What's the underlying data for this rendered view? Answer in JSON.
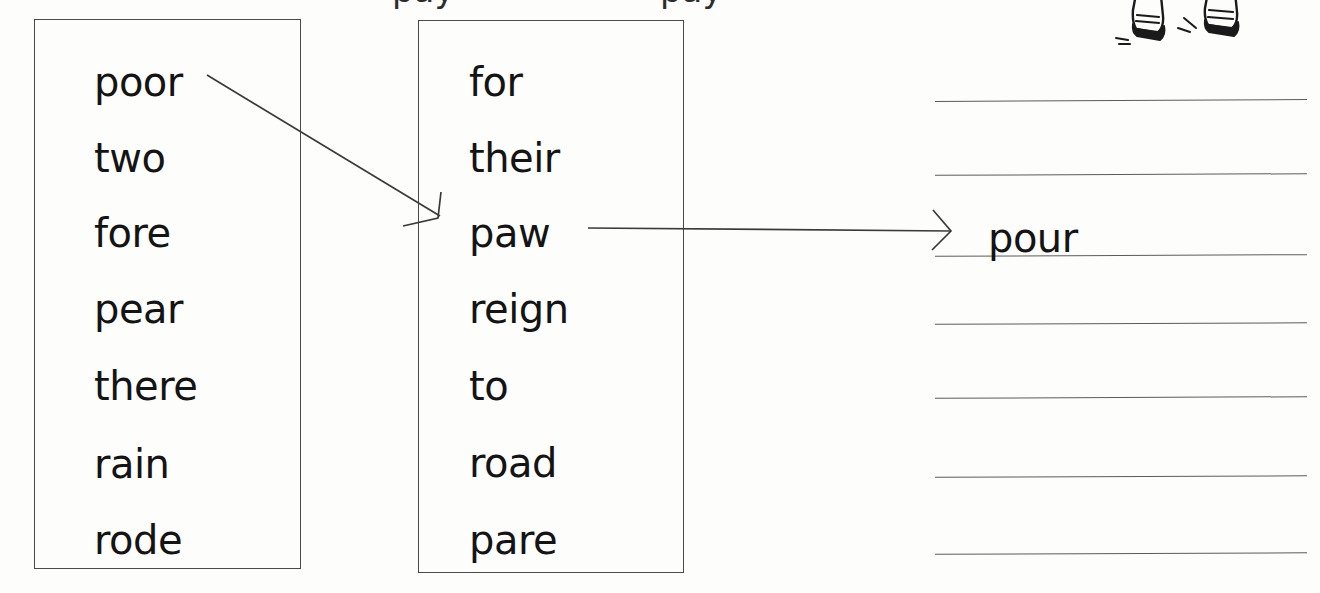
{
  "worksheet": {
    "title": "Homophone matching worksheet",
    "heading_remnant": "pay",
    "ink_color": "#141414",
    "line_color": "#5c5c5c",
    "box_border_color": "#4a4a4a",
    "paper_color": "#fdfdfc"
  },
  "columns": [
    {
      "name": "left-word-box",
      "words": [
        "poor",
        "two",
        "fore",
        "pear",
        "there",
        "rain",
        "rode"
      ]
    },
    {
      "name": "right-word-box",
      "words": [
        "for",
        "their",
        "paw",
        "reign",
        "to",
        "road",
        "pare"
      ]
    }
  ],
  "answer_area": {
    "line_count": 7,
    "entries": [
      {
        "line": 1,
        "text": ""
      },
      {
        "line": 2,
        "text": ""
      },
      {
        "line": 3,
        "text": "pour"
      },
      {
        "line": 4,
        "text": ""
      },
      {
        "line": 5,
        "text": ""
      },
      {
        "line": 6,
        "text": ""
      },
      {
        "line": 7,
        "text": ""
      }
    ]
  },
  "connections": [
    {
      "name": "poor-to-paw",
      "from": "poor",
      "to": "paw",
      "style": "diagonal-arrow"
    },
    {
      "name": "paw-to-pour",
      "from": "paw",
      "to": "pour",
      "style": "horizontal-arrow"
    }
  ],
  "illustration": {
    "name": "shoes-clipart",
    "description": "two shoes with motion lines"
  }
}
